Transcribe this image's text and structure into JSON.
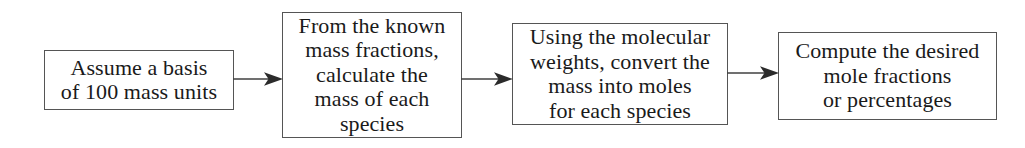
{
  "diagram": {
    "background_color": "#ffffff",
    "line_color": "#555555",
    "text_color": "#1a1a1a",
    "steps": [
      {
        "id": "step-1",
        "text": "Assume a basis\nof 100 mass units",
        "lines": [
          "Assume a basis",
          "of 100 mass units"
        ],
        "x": 44,
        "y": 50,
        "width": 190,
        "height": 60
      },
      {
        "id": "step-2",
        "text": "From the known\nmass fractions,\ncalculate the\nmass of each\nspecies",
        "lines": [
          "From the known",
          "mass fractions,",
          "calculate the",
          "mass of each",
          "species"
        ],
        "x": 282,
        "y": 12,
        "width": 180,
        "height": 126
      },
      {
        "id": "step-3",
        "text": "Using the molecular\nweights, convert the\nmass into moles\nfor each species",
        "lines": [
          "Using the molecular",
          "weights, convert the",
          "mass into moles",
          "for each species"
        ],
        "x": 512,
        "y": 23,
        "width": 216,
        "height": 102
      },
      {
        "id": "step-4",
        "text": "Compute the desired\nmole fractions\nor percentages",
        "lines": [
          "Compute the desired",
          "mole fractions",
          "or percentages"
        ],
        "x": 778,
        "y": 32,
        "width": 219,
        "height": 88
      }
    ],
    "connectors": [
      {
        "id": "arrow-1",
        "from": "step-1",
        "to": "step-2",
        "x": 233,
        "y": 70,
        "length": 50
      },
      {
        "id": "arrow-2",
        "from": "step-2",
        "to": "step-3",
        "x": 461,
        "y": 70,
        "length": 52
      },
      {
        "id": "arrow-3",
        "from": "step-3",
        "to": "step-4",
        "x": 727,
        "y": 64,
        "length": 52
      }
    ]
  }
}
